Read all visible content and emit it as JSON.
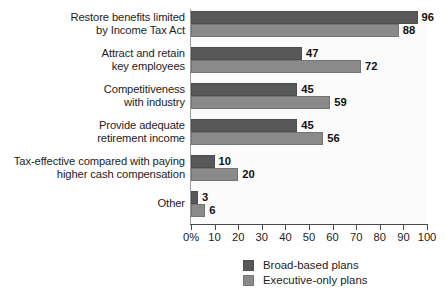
{
  "chart_data": {
    "type": "bar",
    "orientation": "horizontal",
    "title": "",
    "xlabel": "",
    "ylabel": "",
    "xlim": [
      0,
      100
    ],
    "grid": false,
    "legend_position": "bottom-right",
    "categories": [
      "Restore benefits limited\nby Income Tax Act",
      "Attract and retain\nkey employees",
      "Competitiveness\nwith industry",
      "Provide adequate\nretirement income",
      "Tax-effective compared with paying\nhigher cash compensation",
      "Other"
    ],
    "category_lines": [
      [
        "Restore benefits limited",
        "by Income Tax Act"
      ],
      [
        "Attract and retain",
        "key employees"
      ],
      [
        "Competitiveness",
        "with industry"
      ],
      [
        "Provide adequate",
        "retirement income"
      ],
      [
        "Tax-effective compared with paying",
        "higher cash compensation"
      ],
      [
        "Other"
      ]
    ],
    "series": [
      {
        "name": "Broad-based plans",
        "color": "#585858",
        "values": [
          96,
          47,
          45,
          45,
          10,
          3
        ]
      },
      {
        "name": "Executive-only plans",
        "color": "#8a8a8a",
        "values": [
          88,
          72,
          59,
          56,
          20,
          6
        ]
      }
    ],
    "xticks": [
      0,
      10,
      20,
      30,
      40,
      50,
      60,
      70,
      80,
      90,
      100
    ],
    "xtick_labels": [
      "0%",
      "10",
      "20",
      "30",
      "40",
      "50",
      "60",
      "70",
      "80",
      "90",
      "100"
    ]
  },
  "legend": {
    "items": [
      {
        "label": "Broad-based plans",
        "swatch": "broad"
      },
      {
        "label": "Executive-only plans",
        "swatch": "exec"
      }
    ]
  }
}
